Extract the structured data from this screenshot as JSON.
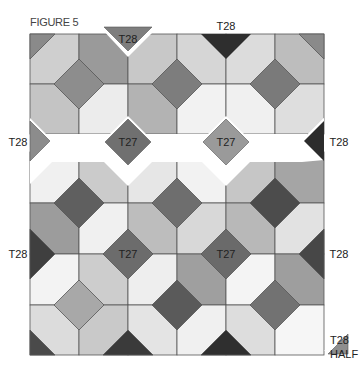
{
  "figure": {
    "title": "FIGURE 5"
  },
  "colors": {
    "white": "#ffffff",
    "light": "#e6e6e6",
    "light2": "#d4d4d4",
    "mid": "#b9b9b9",
    "midDark": "#8f8f8f",
    "dark": "#6b6b6b",
    "darker": "#4f4f4f",
    "black": "#2d2d2d",
    "stroke": "#555555"
  },
  "labels": {
    "top_left_triangle": "T28",
    "top_right_triangle": "T28",
    "left_mid_triangle": "T28",
    "right_mid_triangle": "T28",
    "left_lower_triangle": "T28",
    "right_lower_triangle": "T28",
    "sash_diamond_left": "T27",
    "sash_diamond_right": "T27",
    "lower_diamond_left": "T27",
    "lower_diamond_right": "T27",
    "half_triangle_line1": "T28",
    "half_triangle_line2": "HALF"
  }
}
